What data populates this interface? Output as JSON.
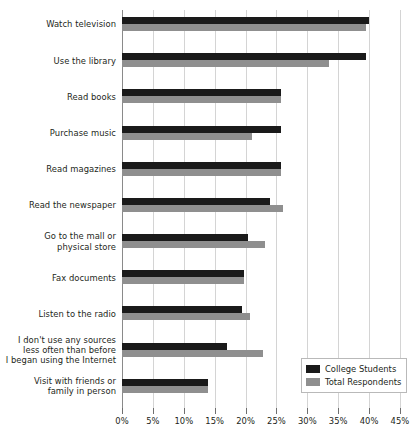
{
  "chart_data": {
    "type": "bar",
    "orientation": "horizontal",
    "title": "",
    "subtitle": "",
    "xlabel": "",
    "ylabel": "",
    "xlim": [
      0,
      45
    ],
    "xtick_labels": [
      "0%",
      "5%",
      "10%",
      "15%",
      "20%",
      "25%",
      "30%",
      "35%",
      "40%",
      "45%"
    ],
    "xticks": [
      0,
      5,
      10,
      15,
      20,
      25,
      30,
      35,
      40,
      45
    ],
    "grid": true,
    "legend_position": "bottom-right",
    "categories": [
      "Watch television",
      "Use the library",
      "Read books",
      "Purchase music",
      "Read magazines",
      "Read the newspaper",
      "Go to the mall or physical store",
      "Fax documents",
      "Listen to the radio",
      "I don't use any sources less often than before I began using the Internet",
      "Visit with friends or family in person"
    ],
    "category_lines": [
      [
        "Watch television"
      ],
      [
        "Use the library"
      ],
      [
        "Read books"
      ],
      [
        "Purchase music"
      ],
      [
        "Read magazines"
      ],
      [
        "Read the newspaper"
      ],
      [
        "Go to the mall or",
        "physical store"
      ],
      [
        "Fax documents"
      ],
      [
        "Listen to the radio"
      ],
      [
        "I don't use any sources",
        "less often than before",
        "I began using the Internet"
      ],
      [
        "Visit with friends or",
        "family in person"
      ]
    ],
    "series": [
      {
        "name": "College Students",
        "color": "#1a1a1a",
        "values": [
          40.0,
          39.5,
          25.8,
          25.8,
          25.8,
          24.0,
          20.4,
          19.7,
          19.4,
          17.0,
          14.0
        ]
      },
      {
        "name": "Total Respondents",
        "color": "#8f8f8f",
        "values": [
          39.5,
          33.5,
          25.8,
          21.0,
          25.8,
          26.0,
          23.1,
          19.7,
          20.8,
          22.8,
          14.0
        ]
      }
    ]
  },
  "legend": {
    "items": [
      {
        "label": "College Students",
        "swatch": "college"
      },
      {
        "label": "Total Respondents",
        "swatch": "total"
      }
    ]
  }
}
